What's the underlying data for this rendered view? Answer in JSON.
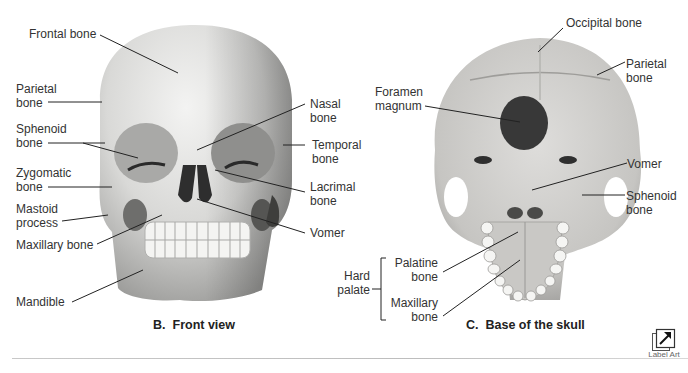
{
  "figures": {
    "front_view": {
      "caption_letter": "B.",
      "caption_text": "Front view",
      "labels": {
        "frontal_bone": "Frontal bone",
        "parietal_bone": "Parietal\nbone",
        "sphenoid_bone": "Sphenoid\nbone",
        "zygomatic_bone": "Zygomatic\nbone",
        "mastoid_process": "Mastoid\nprocess",
        "maxillary_bone": "Maxillary bone",
        "mandible": "Mandible",
        "nasal_bone": "Nasal\nbone",
        "temporal_bone": "Temporal\nbone",
        "lacrimal_bone": "Lacrimal\nbone",
        "vomer": "Vomer"
      }
    },
    "base_view": {
      "caption_letter": "C.",
      "caption_text": "Base of the skull",
      "labels": {
        "occipital_bone": "Occipital bone",
        "parietal_bone": "Parietal\nbone",
        "foramen_magnum": "Foramen\nmagnum",
        "vomer": "Vomer",
        "sphenoid_bone": "Sphenoid\nbone",
        "hard_palate": "Hard\npalate",
        "palatine_bone": "Palatine\nbone",
        "maxillary_bone": "Maxillary\nbone"
      }
    }
  },
  "label_art_button": {
    "label": "Label Art",
    "icon": "arrow-up-right-icon"
  },
  "colors": {
    "bone_light": "#e9e9e7",
    "bone_mid": "#cfcfcc",
    "bone_dark": "#8a8a88",
    "cavity": "#3a3a3a",
    "leader_line": "#222222"
  }
}
